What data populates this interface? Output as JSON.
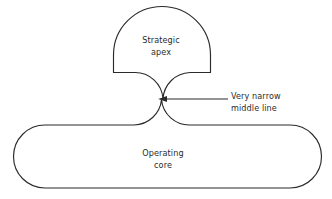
{
  "figure": {
    "type": "organizational-structure-diagram",
    "background_color": "#ffffff",
    "stroke_color": "#2b2b2b",
    "fill_color": "#ffffff",
    "width": 332,
    "height": 199
  },
  "shapes": {
    "strategic_apex": {
      "label_line1": "Strategic",
      "label_line2": "apex",
      "description": "dome / half-round shape at top"
    },
    "operating_core": {
      "label_line1": "Operating",
      "label_line2": "core",
      "description": "wide rounded rectangle at bottom"
    },
    "middle_line": {
      "description": "very narrow waist connecting apex to operating core"
    }
  },
  "annotation": {
    "label_line1": "Very narrow",
    "label_line2": "middle line",
    "arrow_direction": "left",
    "points_to": "middle-line-waist"
  }
}
